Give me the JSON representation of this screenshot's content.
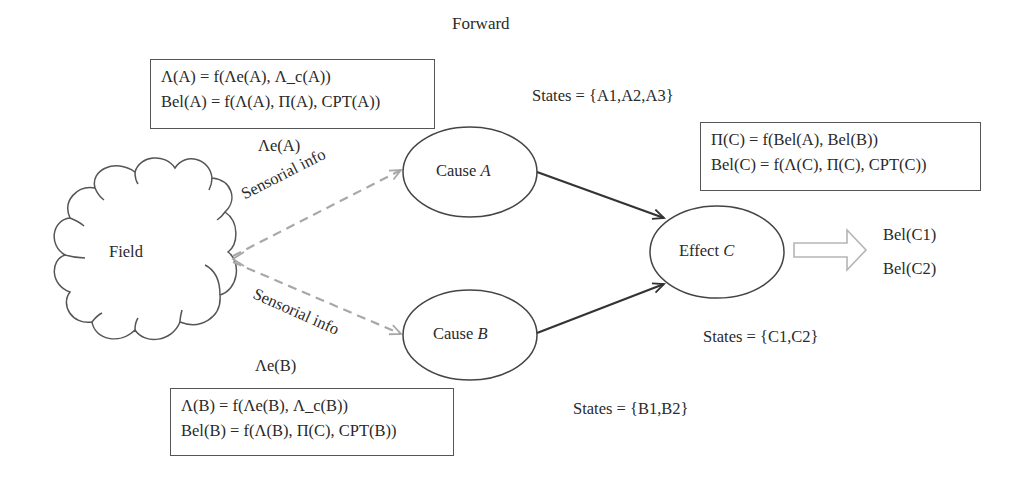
{
  "diagram": {
    "title": "Forward",
    "nodes": {
      "field": {
        "label": "Field",
        "shape": "cloud"
      },
      "cause_a": {
        "label_prefix": "Cause ",
        "label_var": "A",
        "shape": "ellipse"
      },
      "cause_b": {
        "label_prefix": "Cause ",
        "label_var": "B",
        "shape": "ellipse"
      },
      "effect_c": {
        "label_prefix": "Effect ",
        "label_var": "C",
        "shape": "ellipse"
      }
    },
    "edges": {
      "field_to_a": {
        "label": "Sensorial info",
        "style": "dashed",
        "color": "#a8a8a8"
      },
      "field_to_b": {
        "label": "Sensorial info",
        "style": "dashed",
        "color": "#a8a8a8"
      },
      "a_to_c": {
        "style": "solid",
        "color": "#333333"
      },
      "b_to_c": {
        "style": "solid",
        "color": "#333333"
      }
    },
    "equation_boxes": {
      "box_a": {
        "line1": "Λ(A) = f(Λe(A), Λ_c(A))",
        "line2": "Bel(A) = f(Λ(A), Π(A), CPT(A))"
      },
      "box_b": {
        "line1": "Λ(B) = f(Λe(B), Λ_c(B))",
        "line2": "Bel(B) = f(Λ(B), Π(C), CPT(B))"
      },
      "box_c": {
        "line1": "Π(C) = f(Bel(A), Bel(B))",
        "line2": "Bel(C) = f(Λ(C), Π(C), CPT(C))"
      }
    },
    "evidence_labels": {
      "lambda_e_a": "Λe(A)",
      "lambda_e_b": "Λe(B)"
    },
    "states": {
      "a": "States = {A1,A2,A3}",
      "b": "States = {B1,B2}",
      "c": "States = {C1,C2}"
    },
    "outputs": {
      "bel_c1": "Bel(C1)",
      "bel_c2": "Bel(C2)"
    },
    "colors": {
      "line": "#333333",
      "dashed": "#a8a8a8",
      "hollow_arrow": "#b5b5b5",
      "text": "#2a2a2a"
    }
  }
}
